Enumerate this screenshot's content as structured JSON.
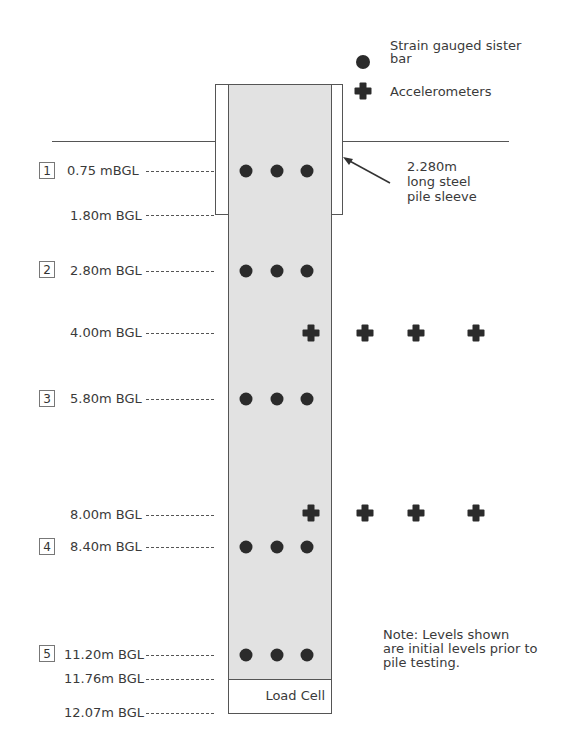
{
  "legend": {
    "strain_label": "Strain gauged sister bar",
    "strain_line1": "Strain gauged sister",
    "strain_line2": "bar",
    "accel_label": "Accelerometers"
  },
  "sleeve_note": {
    "line1": "2.280m",
    "line2": "long steel",
    "line3": "pile sleeve"
  },
  "load_cell_label": "Load Cell",
  "note": {
    "line1": "Note: Levels shown",
    "line2": "are initial levels prior to",
    "line3": "pile testing."
  },
  "levels": [
    {
      "number": "1",
      "label": "0.75 mBGL",
      "depth_m": 0.75,
      "instrument": "strain"
    },
    {
      "number": "",
      "label": "1.80m BGL",
      "depth_m": 1.8,
      "instrument": "sleeve-bottom"
    },
    {
      "number": "2",
      "label": "2.80m BGL",
      "depth_m": 2.8,
      "instrument": "strain"
    },
    {
      "number": "",
      "label": "4.00m BGL",
      "depth_m": 4.0,
      "instrument": "accelerometers"
    },
    {
      "number": "3",
      "label": "5.80m BGL",
      "depth_m": 5.8,
      "instrument": "strain"
    },
    {
      "number": "",
      "label": "8.00m BGL",
      "depth_m": 8.0,
      "instrument": "accelerometers"
    },
    {
      "number": "4",
      "label": "8.40m BGL",
      "depth_m": 8.4,
      "instrument": "strain"
    },
    {
      "number": "5",
      "label": "11.20m BGL",
      "depth_m": 11.2,
      "instrument": "strain"
    },
    {
      "number": "",
      "label": "11.76m BGL",
      "depth_m": 11.76,
      "instrument": "load-cell-top"
    },
    {
      "number": "",
      "label": "12.07m BGL",
      "depth_m": 12.07,
      "instrument": "pile-toe"
    }
  ],
  "colors": {
    "pile_fill": "#e2e2e2",
    "marker": "#2b2b2b",
    "line": "#555555"
  }
}
